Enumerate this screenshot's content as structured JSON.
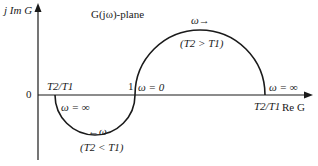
{
  "diagram": {
    "title": "G(jω)-plane",
    "axes": {
      "y_label": "j Im G",
      "x_label": "Re G",
      "origin_label": "0"
    },
    "points": {
      "one": "1",
      "left_point": "T2/T1",
      "right_point": "T2/T1"
    },
    "upper_curve": {
      "start_label": "ω = 0",
      "end_label": "ω = ∞",
      "direction_label": "ω→",
      "condition": "(T2 > T1)"
    },
    "lower_curve": {
      "start_label": "ω = ∞",
      "direction_label": "←ω",
      "condition": "(T2 < T1)"
    },
    "colors": {
      "line": "#1a1a1a",
      "background": "#ffffff"
    }
  }
}
